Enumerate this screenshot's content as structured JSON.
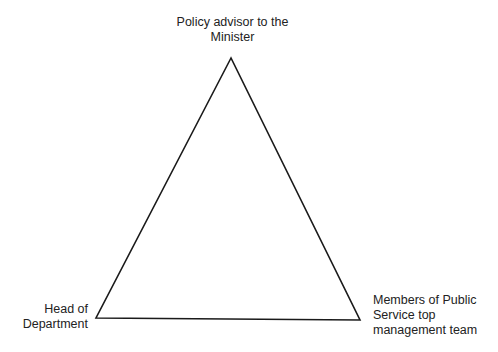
{
  "diagram": {
    "type": "triangle",
    "stroke_color": "#1a1a1a",
    "vertices": {
      "top": {
        "x": 231,
        "y": 58
      },
      "bottom_left": {
        "x": 96,
        "y": 318
      },
      "bottom_right": {
        "x": 360,
        "y": 320
      }
    },
    "nodes": {
      "top": {
        "lines": [
          "Policy advisor to the",
          "Minister"
        ]
      },
      "bottom_left": {
        "lines": [
          "Head of",
          "Department"
        ]
      },
      "bottom_right": {
        "lines": [
          "Members of Public",
          "Service top",
          "management team"
        ]
      }
    }
  }
}
